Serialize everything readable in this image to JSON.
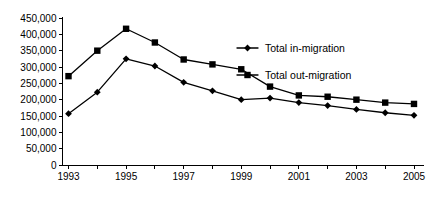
{
  "chart_data": {
    "type": "line",
    "title": "",
    "xlabel": "",
    "ylabel": "",
    "x": [
      1993,
      1994,
      1995,
      1996,
      1997,
      1998,
      1999,
      2000,
      2001,
      2002,
      2003,
      2004,
      2005
    ],
    "categories": [
      "1993",
      "1994",
      "1995",
      "1996",
      "1997",
      "1998",
      "1999",
      "2000",
      "2001",
      "2002",
      "2003",
      "2004",
      "2005"
    ],
    "series": [
      {
        "name": "Total in-migration",
        "marker": "diamond",
        "color": "#000000",
        "values": [
          157000,
          223000,
          325000,
          303000,
          253000,
          227000,
          200000,
          205000,
          191000,
          182000,
          170000,
          160000,
          152000
        ]
      },
      {
        "name": "Total out-migration",
        "marker": "square",
        "color": "#000000",
        "values": [
          272000,
          350000,
          417000,
          375000,
          323000,
          308000,
          293000,
          240000,
          213000,
          209000,
          200000,
          191000,
          187000
        ]
      }
    ],
    "ylim": [
      0,
      450000
    ],
    "ytick_values": [
      0,
      50000,
      100000,
      150000,
      200000,
      250000,
      300000,
      350000,
      400000,
      450000
    ],
    "ytick_labels": [
      "0",
      "50,000",
      "100,000",
      "150,000",
      "200,000",
      "250,000",
      "300,000",
      "350,000",
      "400,000",
      "450,000"
    ],
    "xtick_values": [
      1993,
      1995,
      1997,
      1999,
      2001,
      2003,
      2005
    ],
    "xtick_labels": [
      "1993",
      "1995",
      "1997",
      "1999",
      "2001",
      "2003",
      "2005"
    ],
    "grid": false,
    "legend_position": "upper-right",
    "legend": [
      {
        "label": "Total in-migration",
        "marker": "diamond"
      },
      {
        "label": "Total out-migration",
        "marker": "square"
      }
    ]
  }
}
